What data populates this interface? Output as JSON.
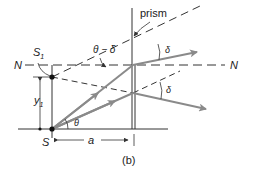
{
  "figure": {
    "caption": "(b)",
    "labels": {
      "prism": "prism",
      "n_left": "N",
      "n_right": "N",
      "s1": "S",
      "s1_sub": "1",
      "s": "S",
      "y1": "y",
      "y1_sub": "1",
      "theta": "θ",
      "theta_minus_delta": "θ − δ",
      "delta_upper": "δ",
      "delta_lower": "δ",
      "a": "a"
    },
    "colors": {
      "line": "#333333",
      "ray": "#8a8a8a",
      "background": "#ffffff"
    }
  }
}
